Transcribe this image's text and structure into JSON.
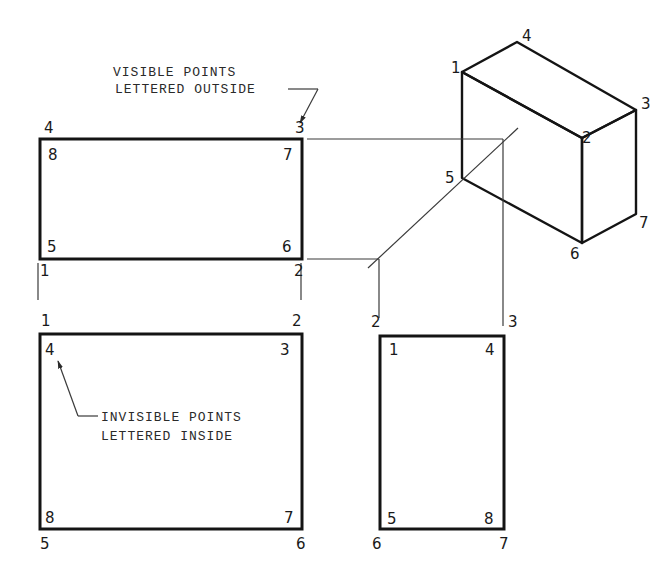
{
  "annotations": {
    "visible_note": [
      "VISIBLE POINTS",
      "LETTERED OUTSIDE"
    ],
    "invisible_note": [
      "INVISIBLE POINTS",
      "LETTERED INSIDE"
    ]
  },
  "top_view": {
    "outside_labels": {
      "top_left": "4",
      "top_right": "3",
      "bottom_left": "1",
      "bottom_right": "2"
    },
    "inside_labels": {
      "top_left": "8",
      "top_right": "7",
      "bottom_left": "5",
      "bottom_right": "6"
    }
  },
  "front_view": {
    "outside_labels": {
      "top_left": "1",
      "top_right": "2",
      "bottom_left": "5",
      "bottom_right": "6"
    },
    "inside_labels": {
      "top_left": "4",
      "top_right": "3",
      "bottom_left": "8",
      "bottom_right": "7"
    }
  },
  "side_view": {
    "outside_labels": {
      "top_left": "2",
      "top_right": "3",
      "bottom_left": "6",
      "bottom_right": "7"
    },
    "inside_labels": {
      "top_left": "1",
      "top_right": "4",
      "bottom_left": "5",
      "bottom_right": "8"
    }
  },
  "isometric": {
    "labels": {
      "p1": "1",
      "p2": "2",
      "p3": "3",
      "p4": "4",
      "p5": "5",
      "p6": "6",
      "p7": "7"
    },
    "front_face_color": "#d6d6d6",
    "side_face_color": "#b4b4b4",
    "top_face_color": "#ffffff"
  }
}
